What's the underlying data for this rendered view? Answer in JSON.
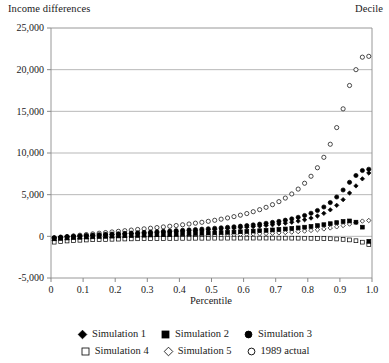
{
  "header": {
    "y_axis_caption": "Income differences",
    "right_caption": "Decile"
  },
  "chart_data": {
    "type": "scatter",
    "title": "Income differences",
    "xlabel": "Percentile",
    "ylabel": "Income differences",
    "right_label": "Decile",
    "xlim": [
      0,
      1.0
    ],
    "ylim": [
      -5000,
      25000
    ],
    "xticks": [
      0,
      0.1,
      0.2,
      0.3,
      0.4,
      0.5,
      0.6,
      0.7,
      0.8,
      0.9,
      1.0
    ],
    "xtick_labels": [
      "0",
      "0.1",
      "0.2",
      "0.3",
      "0.4",
      "0.5",
      "0.6",
      "0.7",
      "0.8",
      "0.9",
      "1.0"
    ],
    "yticks": [
      -5000,
      0,
      5000,
      10000,
      15000,
      20000,
      25000
    ],
    "ytick_labels": [
      "-5,000",
      "0",
      "5,000",
      "10,000",
      "15,000",
      "20,000",
      "25,000"
    ],
    "grid": "horizontal",
    "legend_position": "below",
    "marker_color": "#000000",
    "series": [
      {
        "name": "Simulation 1",
        "marker": "filled-diamond",
        "x": [
          0.01,
          0.03,
          0.05,
          0.07,
          0.09,
          0.11,
          0.13,
          0.15,
          0.17,
          0.19,
          0.21,
          0.23,
          0.25,
          0.27,
          0.29,
          0.31,
          0.33,
          0.35,
          0.37,
          0.39,
          0.41,
          0.43,
          0.45,
          0.47,
          0.49,
          0.51,
          0.53,
          0.55,
          0.57,
          0.59,
          0.61,
          0.63,
          0.65,
          0.67,
          0.69,
          0.71,
          0.73,
          0.75,
          0.77,
          0.79,
          0.81,
          0.83,
          0.85,
          0.87,
          0.89,
          0.91,
          0.93,
          0.95,
          0.97,
          0.99
        ],
        "y": [
          -180,
          -120,
          -60,
          -10,
          30,
          70,
          110,
          150,
          190,
          230,
          265,
          300,
          335,
          370,
          405,
          440,
          475,
          510,
          545,
          580,
          620,
          660,
          700,
          740,
          785,
          830,
          880,
          930,
          985,
          1040,
          1100,
          1165,
          1235,
          1310,
          1390,
          1480,
          1580,
          1695,
          1830,
          1990,
          2190,
          2440,
          2760,
          3180,
          3720,
          4400,
          5200,
          6050,
          6900,
          7600
        ]
      },
      {
        "name": "Simulation 2",
        "marker": "filled-square",
        "x": [
          0.01,
          0.03,
          0.05,
          0.07,
          0.09,
          0.11,
          0.13,
          0.15,
          0.17,
          0.19,
          0.21,
          0.23,
          0.25,
          0.27,
          0.29,
          0.31,
          0.33,
          0.35,
          0.37,
          0.39,
          0.41,
          0.43,
          0.45,
          0.47,
          0.49,
          0.51,
          0.53,
          0.55,
          0.57,
          0.59,
          0.61,
          0.63,
          0.65,
          0.67,
          0.69,
          0.71,
          0.73,
          0.75,
          0.77,
          0.79,
          0.81,
          0.83,
          0.85,
          0.87,
          0.89,
          0.91,
          0.93,
          0.95,
          0.97,
          0.99
        ],
        "y": [
          -300,
          -250,
          -200,
          -160,
          -120,
          -90,
          -60,
          -30,
          -5,
          20,
          45,
          70,
          95,
          115,
          140,
          165,
          190,
          210,
          235,
          260,
          285,
          310,
          335,
          360,
          390,
          420,
          450,
          480,
          515,
          550,
          590,
          630,
          675,
          720,
          770,
          825,
          885,
          950,
          1020,
          1100,
          1190,
          1290,
          1400,
          1520,
          1650,
          1780,
          1850,
          1700,
          1100,
          -600
        ]
      },
      {
        "name": "Simulation 3",
        "marker": "filled-circle",
        "x": [
          0.01,
          0.03,
          0.05,
          0.07,
          0.09,
          0.11,
          0.13,
          0.15,
          0.17,
          0.19,
          0.21,
          0.23,
          0.25,
          0.27,
          0.29,
          0.31,
          0.33,
          0.35,
          0.37,
          0.39,
          0.41,
          0.43,
          0.45,
          0.47,
          0.49,
          0.51,
          0.53,
          0.55,
          0.57,
          0.59,
          0.61,
          0.63,
          0.65,
          0.67,
          0.69,
          0.71,
          0.73,
          0.75,
          0.77,
          0.79,
          0.81,
          0.83,
          0.85,
          0.87,
          0.89,
          0.91,
          0.93,
          0.95,
          0.97,
          0.99
        ],
        "y": [
          -150,
          -90,
          -40,
          10,
          55,
          100,
          145,
          190,
          230,
          270,
          310,
          350,
          390,
          430,
          470,
          510,
          550,
          590,
          630,
          675,
          720,
          765,
          810,
          860,
          910,
          965,
          1020,
          1080,
          1145,
          1215,
          1290,
          1370,
          1460,
          1560,
          1670,
          1795,
          1935,
          2095,
          2280,
          2500,
          2770,
          3100,
          3520,
          4050,
          4720,
          5560,
          6480,
          7300,
          7900,
          8050
        ]
      },
      {
        "name": "Simulation 4",
        "marker": "open-square",
        "x": [
          0.01,
          0.03,
          0.05,
          0.07,
          0.09,
          0.11,
          0.13,
          0.15,
          0.17,
          0.19,
          0.21,
          0.23,
          0.25,
          0.27,
          0.29,
          0.31,
          0.33,
          0.35,
          0.37,
          0.39,
          0.41,
          0.43,
          0.45,
          0.47,
          0.49,
          0.51,
          0.53,
          0.55,
          0.57,
          0.59,
          0.61,
          0.63,
          0.65,
          0.67,
          0.69,
          0.71,
          0.73,
          0.75,
          0.77,
          0.79,
          0.81,
          0.83,
          0.85,
          0.87,
          0.89,
          0.91,
          0.93,
          0.95,
          0.97,
          0.99
        ],
        "y": [
          -700,
          -620,
          -560,
          -510,
          -470,
          -440,
          -410,
          -390,
          -370,
          -350,
          -335,
          -320,
          -305,
          -295,
          -285,
          -275,
          -265,
          -255,
          -250,
          -245,
          -240,
          -235,
          -230,
          -228,
          -225,
          -222,
          -220,
          -218,
          -216,
          -215,
          -214,
          -213,
          -212,
          -212,
          -212,
          -213,
          -215,
          -218,
          -222,
          -228,
          -236,
          -248,
          -264,
          -286,
          -318,
          -364,
          -430,
          -530,
          -700,
          -1000
        ]
      },
      {
        "name": "Simulation 5",
        "marker": "open-diamond",
        "x": [
          0.01,
          0.03,
          0.05,
          0.07,
          0.09,
          0.11,
          0.13,
          0.15,
          0.17,
          0.19,
          0.21,
          0.23,
          0.25,
          0.27,
          0.29,
          0.31,
          0.33,
          0.35,
          0.37,
          0.39,
          0.41,
          0.43,
          0.45,
          0.47,
          0.49,
          0.51,
          0.53,
          0.55,
          0.57,
          0.59,
          0.61,
          0.63,
          0.65,
          0.67,
          0.69,
          0.71,
          0.73,
          0.75,
          0.77,
          0.79,
          0.81,
          0.83,
          0.85,
          0.87,
          0.89,
          0.91,
          0.93,
          0.95,
          0.97,
          0.99
        ],
        "y": [
          -520,
          -440,
          -380,
          -330,
          -290,
          -255,
          -225,
          -195,
          -170,
          -145,
          -125,
          -105,
          -85,
          -68,
          -50,
          -34,
          -18,
          -2,
          14,
          30,
          46,
          62,
          80,
          98,
          116,
          136,
          156,
          178,
          200,
          224,
          250,
          278,
          308,
          340,
          376,
          416,
          460,
          510,
          566,
          630,
          704,
          790,
          890,
          1006,
          1140,
          1296,
          1470,
          1660,
          1830,
          1900
        ]
      },
      {
        "name": "1989 actual",
        "marker": "open-circle",
        "x": [
          0.01,
          0.03,
          0.05,
          0.07,
          0.09,
          0.11,
          0.13,
          0.15,
          0.17,
          0.19,
          0.21,
          0.23,
          0.25,
          0.27,
          0.29,
          0.31,
          0.33,
          0.35,
          0.37,
          0.39,
          0.41,
          0.43,
          0.45,
          0.47,
          0.49,
          0.51,
          0.53,
          0.55,
          0.57,
          0.59,
          0.61,
          0.63,
          0.65,
          0.67,
          0.69,
          0.71,
          0.73,
          0.75,
          0.77,
          0.79,
          0.81,
          0.83,
          0.85,
          0.87,
          0.89,
          0.91,
          0.93,
          0.95,
          0.97,
          0.99
        ],
        "y": [
          -260,
          -140,
          -40,
          50,
          135,
          215,
          295,
          375,
          450,
          525,
          600,
          675,
          750,
          825,
          900,
          975,
          1050,
          1130,
          1210,
          1295,
          1385,
          1480,
          1580,
          1685,
          1800,
          1925,
          2060,
          2205,
          2365,
          2540,
          2735,
          2955,
          3200,
          3480,
          3800,
          4165,
          4590,
          5085,
          5670,
          6370,
          7210,
          8230,
          9480,
          11050,
          13050,
          15300,
          18100,
          20000,
          21500,
          21600
        ]
      }
    ],
    "n_points_per_series": 50
  },
  "legend": {
    "rows": [
      [
        {
          "label": "Simulation 1",
          "marker": "filled-diamond"
        },
        {
          "label": "Simulation 2",
          "marker": "filled-square"
        },
        {
          "label": "Simulation 3",
          "marker": "filled-circle"
        }
      ],
      [
        {
          "label": "Simulation 4",
          "marker": "open-square"
        },
        {
          "label": "Simulation 5",
          "marker": "open-diamond"
        },
        {
          "label": "1989 actual",
          "marker": "open-circle"
        }
      ]
    ]
  }
}
